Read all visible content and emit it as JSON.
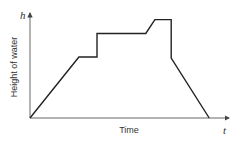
{
  "chart_data": {
    "type": "line",
    "title": "",
    "xlabel": "Time",
    "ylabel": "Height of water",
    "x_axis_symbol": "t",
    "y_axis_symbol": "h",
    "grid": false,
    "legend": null,
    "tick_labels": false,
    "series": [
      {
        "name": "Height of water",
        "points_relative": [
          {
            "t": 0.0,
            "h": 0.0
          },
          {
            "t": 0.27,
            "h": 0.57
          },
          {
            "t": 0.37,
            "h": 0.57
          },
          {
            "t": 0.37,
            "h": 0.79
          },
          {
            "t": 0.64,
            "h": 0.79
          },
          {
            "t": 0.69,
            "h": 0.92
          },
          {
            "t": 0.78,
            "h": 0.92
          },
          {
            "t": 0.78,
            "h": 0.56
          },
          {
            "t": 0.99,
            "h": 0.0
          }
        ]
      }
    ],
    "axis_ranges": {
      "t": [
        0,
        1
      ],
      "h": [
        0,
        1
      ]
    },
    "colors": {
      "line": "#222222",
      "axes": "#444444",
      "text": "#333333"
    }
  }
}
